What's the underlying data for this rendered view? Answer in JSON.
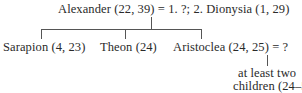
{
  "family_tree": {
    "root": {
      "name": "Alexander",
      "refs": "(22, 39)",
      "marriage_sign": "=",
      "spouses": "1. ?; 2. Dionysia (1, 29)",
      "full_label": "Alexander (22, 39) = 1. ?; 2. Dionysia (1, 29)"
    },
    "children": [
      {
        "name": "Sarapion",
        "refs": "(4, 23)",
        "label": "Sarapion (4, 23)"
      },
      {
        "name": "Theon",
        "refs": "(24)",
        "label": "Theon (24)"
      },
      {
        "name": "Aristoclea",
        "refs": "(24, 25)",
        "spouse": "?",
        "label": "Aristoclea (24, 25) = ?"
      }
    ],
    "grandchildren": {
      "line1": "at least two",
      "line2": "children (24–5)"
    }
  },
  "colors": {
    "text": "#2a2a2a",
    "lines": "#555555",
    "background": "#ffffff"
  }
}
